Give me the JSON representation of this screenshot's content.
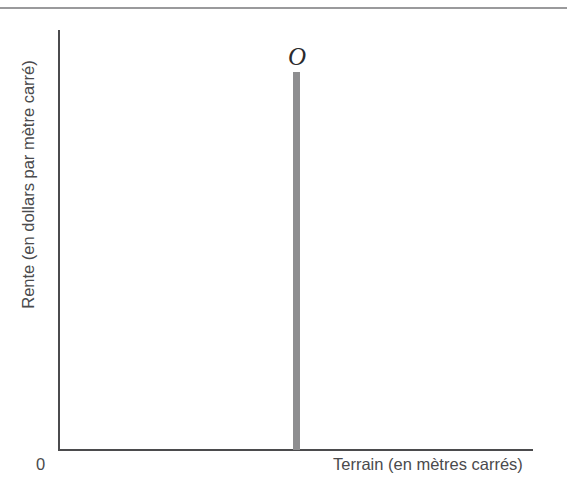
{
  "chart_data": {
    "type": "line",
    "title": "",
    "subtitle": "",
    "xlabel": "Terrain (en mètres carrés)",
    "ylabel": "Rente (en dollars par mètre carré)",
    "origin_label": "0",
    "grid": false,
    "legend_position": "none",
    "xlim": [
      0,
      100
    ],
    "ylim": [
      0,
      100
    ],
    "xticks": [],
    "yticks": [],
    "annotations": [
      {
        "text": "O",
        "meaning": "offre-curve-label",
        "x": 50,
        "y": 101
      }
    ],
    "series": [
      {
        "name": "O",
        "description": "Courbe d'offre de terrain parfaitement inélastique (verticale)",
        "type": "vertical-line",
        "x": [
          50,
          50
        ],
        "y": [
          0,
          100
        ],
        "color": "#8e8e90"
      }
    ]
  },
  "figure": {
    "top_rule_color": "#9a9a9c",
    "axis_color": "#4b4b4d",
    "text_color": "#4a4a4c",
    "curve_color": "#8e8e90",
    "background_color": "#ffffff"
  },
  "labels": {
    "y_axis_title": "Rente (en dollars par mètre carré)",
    "x_axis_title": "Terrain (en mètres carrés)",
    "origin": "0",
    "curve": "O"
  }
}
